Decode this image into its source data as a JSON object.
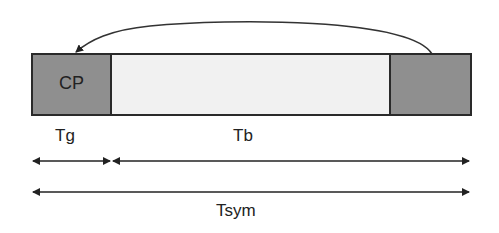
{
  "blocks": {
    "cp_label": "CP",
    "cp_color": "#8f8f8f",
    "body_color": "#f1f1f1",
    "tail_color": "#8f8f8f",
    "border_color": "#2a2a2a"
  },
  "labels": {
    "guard": "Tg",
    "body": "Tb",
    "symbol": "Tsym"
  },
  "arrows": {
    "copy_arrow": "curved arrow from end of symbol to CP",
    "tg_span": "double-headed arrow spanning guard interval",
    "tb_span": "double-headed arrow spanning useful symbol",
    "tsym_span": "double-headed arrow spanning full symbol"
  }
}
